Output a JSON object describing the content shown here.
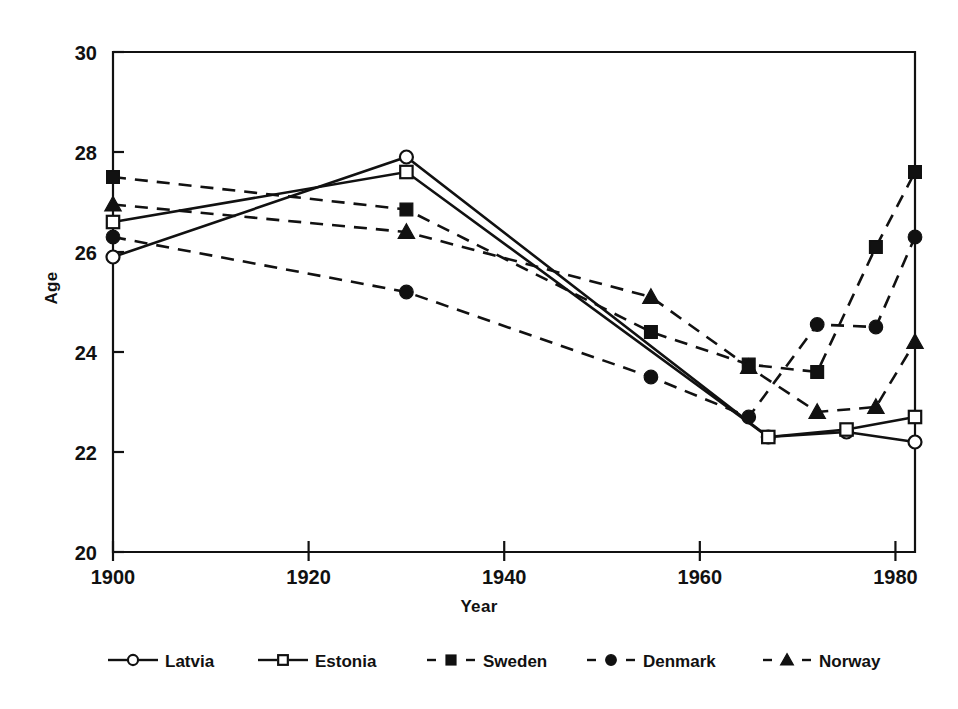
{
  "figure": {
    "background": "#ffffff",
    "ink_color": "#111111"
  },
  "chart_data": {
    "type": "line",
    "title": "",
    "xlabel": "Year",
    "ylabel": "Age",
    "xlim": [
      1898,
      1982.5
    ],
    "ylim": [
      20,
      30
    ],
    "xticks": [
      1900,
      1920,
      1940,
      1960,
      1980
    ],
    "xtick_labels": [
      "1900",
      "1920",
      "1940",
      "1960",
      "1980"
    ],
    "yticks": [
      20,
      22,
      24,
      26,
      28,
      30
    ],
    "ytick_labels": [
      "20",
      "22",
      "24",
      "26",
      "28",
      "30"
    ],
    "grid": false,
    "legend_position": "below",
    "series": [
      {
        "name": "Latvia",
        "marker": "open-circle",
        "linestyle": "solid",
        "color": "#111111",
        "x": [
          1900,
          1930,
          1967,
          1975,
          1982
        ],
        "y": [
          25.9,
          27.9,
          22.3,
          22.4,
          22.2
        ]
      },
      {
        "name": "Estonia",
        "marker": "open-square",
        "linestyle": "solid",
        "color": "#111111",
        "x": [
          1900,
          1930,
          1967,
          1975,
          1982
        ],
        "y": [
          26.6,
          27.6,
          22.3,
          22.45,
          22.7
        ]
      },
      {
        "name": "Sweden",
        "marker": "filled-square",
        "linestyle": "dashed",
        "color": "#111111",
        "x": [
          1900,
          1930,
          1955,
          1965,
          1972,
          1978,
          1982
        ],
        "y": [
          27.5,
          26.85,
          24.4,
          23.75,
          23.6,
          26.1,
          27.6
        ]
      },
      {
        "name": "Denmark",
        "marker": "filled-circle",
        "linestyle": "dashed",
        "color": "#111111",
        "x": [
          1900,
          1930,
          1955,
          1965,
          1972,
          1978,
          1982
        ],
        "y": [
          26.3,
          25.2,
          23.5,
          22.7,
          24.55,
          24.5,
          26.3
        ]
      },
      {
        "name": "Norway",
        "marker": "filled-triangle",
        "linestyle": "dashed",
        "color": "#111111",
        "x": [
          1900,
          1930,
          1955,
          1965,
          1972,
          1978,
          1982
        ],
        "y": [
          26.95,
          26.4,
          25.1,
          23.7,
          22.8,
          22.9,
          24.2
        ]
      }
    ],
    "legend": [
      {
        "label": "Latvia",
        "marker": "open-circle",
        "linestyle": "solid"
      },
      {
        "label": "Estonia",
        "marker": "open-square",
        "linestyle": "solid"
      },
      {
        "label": "Sweden",
        "marker": "filled-square",
        "linestyle": "dashed"
      },
      {
        "label": "Denmark",
        "marker": "filled-circle",
        "linestyle": "dashed"
      },
      {
        "label": "Norway",
        "marker": "filled-triangle",
        "linestyle": "dashed"
      }
    ]
  }
}
